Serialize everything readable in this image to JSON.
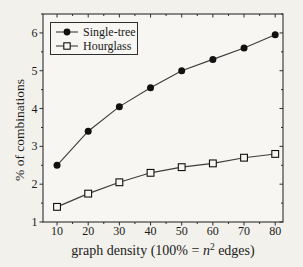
{
  "figure": {
    "background": "#f2f1ec",
    "plot_background": "#f7f6f2",
    "frame_color": "#2e2e2e",
    "line_color": "#3c3c3c",
    "marker_color": "#111111",
    "text_color": "#1b1b1b"
  },
  "chart_data": {
    "type": "line",
    "x": [
      10,
      20,
      30,
      40,
      50,
      60,
      70,
      80
    ],
    "series": [
      {
        "name": "Single-tree",
        "marker": "filled-circle",
        "values": [
          2.5,
          3.4,
          4.05,
          4.55,
          5.0,
          5.3,
          5.6,
          5.95
        ]
      },
      {
        "name": "Hourglass",
        "marker": "open-square",
        "values": [
          1.4,
          1.75,
          2.05,
          2.3,
          2.45,
          2.55,
          2.7,
          2.8
        ]
      }
    ],
    "xlabel": "graph density (100% = n² edges)",
    "ylabel": "% of combinations",
    "xlim": [
      5.5,
      82.5
    ],
    "ylim": [
      1,
      6.5
    ],
    "x_ticks": [
      10,
      20,
      30,
      40,
      50,
      60,
      70,
      80
    ],
    "y_ticks": [
      1,
      2,
      3,
      4,
      5,
      6
    ],
    "x_minor_step": 5,
    "y_minor_step": 0.5,
    "grid": false,
    "legend_position": "top-left"
  },
  "labels": {
    "xlabel_prefix": "graph density (100% = ",
    "xlabel_var": "n",
    "xlabel_sup": "2",
    "xlabel_suffix": " edges)",
    "ylabel": "% of combinations"
  }
}
